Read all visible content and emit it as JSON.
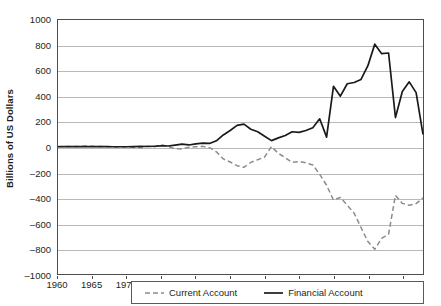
{
  "chart_data": {
    "type": "line",
    "title": "",
    "subtitle": "",
    "xlabel": "",
    "ylabel": "Billions of US Dollars",
    "xlim": [
      1960,
      2013
    ],
    "ylim": [
      -1000,
      1000
    ],
    "grid": true,
    "legend_position": "bottom",
    "y_ticks": [
      1000,
      800,
      600,
      400,
      200,
      0,
      -200,
      -400,
      -600,
      -800,
      -1000
    ],
    "y_tick_labels": [
      "1000",
      "800",
      "600",
      "400",
      "200",
      "0",
      "–200",
      "–400",
      "–600",
      "–800",
      "–1000"
    ],
    "x_ticks": [
      1960,
      1965,
      1970,
      1975,
      1980,
      1985,
      1990,
      1995,
      2000,
      2005,
      2010
    ],
    "x_tick_labels": [
      "1960",
      "1965",
      "1970",
      "1975",
      "1980",
      "1985",
      "1990",
      "1995",
      "2000",
      "2005",
      "2010"
    ],
    "x": [
      1960,
      1961,
      1962,
      1963,
      1964,
      1965,
      1966,
      1967,
      1968,
      1969,
      1970,
      1971,
      1972,
      1973,
      1974,
      1975,
      1976,
      1977,
      1978,
      1979,
      1980,
      1981,
      1982,
      1983,
      1984,
      1985,
      1986,
      1987,
      1988,
      1989,
      1990,
      1991,
      1992,
      1993,
      1994,
      1995,
      1996,
      1997,
      1998,
      1999,
      2000,
      2001,
      2002,
      2003,
      2004,
      2005,
      2006,
      2007,
      2008,
      2009,
      2010,
      2011,
      2012,
      2013
    ],
    "series": [
      {
        "name": "Current Account",
        "style": "dashed",
        "color": "#8c8c8c",
        "values": [
          3,
          4,
          3,
          4,
          7,
          5,
          3,
          3,
          1,
          0,
          2,
          -1,
          -6,
          7,
          2,
          18,
          4,
          -14,
          -15,
          -1,
          2,
          5,
          -5,
          -38,
          -94,
          -118,
          -147,
          -160,
          -121,
          -100,
          -79,
          3,
          -50,
          -85,
          -121,
          -114,
          -125,
          -141,
          -215,
          -301,
          -417,
          -398,
          -459,
          -521,
          -634,
          -745,
          -806,
          -719,
          -687,
          -381,
          -444,
          -459,
          -446,
          -400
        ]
      },
      {
        "name": "Financial Account",
        "style": "solid",
        "color": "#1a1a1a",
        "values": [
          2,
          3,
          3,
          3,
          4,
          3,
          3,
          3,
          2,
          2,
          2,
          3,
          5,
          4,
          6,
          9,
          8,
          15,
          22,
          16,
          25,
          30,
          28,
          49,
          95,
          130,
          170,
          180,
          140,
          120,
          85,
          50,
          72,
          91,
          120,
          115,
          130,
          152,
          222,
          78,
          478,
          400,
          498,
          508,
          532,
          640,
          810,
          735,
          740,
          232,
          437,
          513,
          428,
          100
        ]
      }
    ]
  },
  "legend": {
    "items": [
      {
        "label": "Current Account"
      },
      {
        "label": "Financial Account"
      }
    ]
  }
}
